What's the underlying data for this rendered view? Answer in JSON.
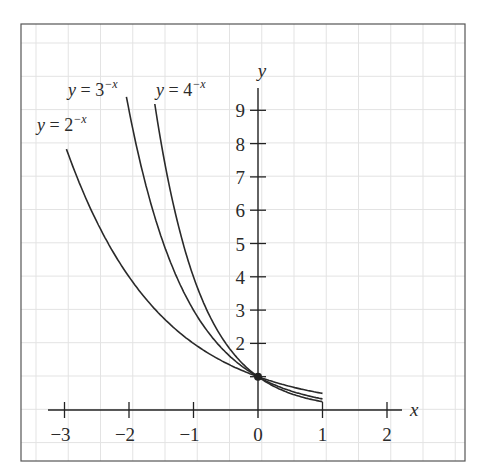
{
  "chart_data": {
    "type": "line",
    "title": "",
    "xlabel": "x",
    "ylabel": "y",
    "xlim": [
      -3.3,
      2.3
    ],
    "ylim": [
      0,
      9.5
    ],
    "x_ticks": [
      -3,
      -2,
      -1,
      0,
      1,
      2
    ],
    "x_tick_labels": [
      "−3",
      "−2",
      "−1",
      "0",
      "1",
      "2"
    ],
    "y_ticks": [
      1,
      2,
      3,
      4,
      5,
      6,
      7,
      8,
      9
    ],
    "y_tick_labels": [
      "",
      "2",
      "3",
      "4",
      "5",
      "6",
      "7",
      "8",
      "9"
    ],
    "grid": true,
    "series": [
      {
        "name": "y = 2^-x",
        "label_base": "y = 2",
        "label_exp": "−x",
        "base": 2,
        "x_range": [
          -2.97,
          1
        ],
        "points": [
          [
            -3,
            8
          ],
          [
            -2,
            4
          ],
          [
            -1,
            2
          ],
          [
            0,
            1
          ],
          [
            1,
            0.5
          ]
        ]
      },
      {
        "name": "y = 3^-x",
        "label_base": "y = 3",
        "label_exp": "−x",
        "base": 3,
        "x_range": [
          -2.04,
          1
        ],
        "points": [
          [
            -2,
            9
          ],
          [
            -1,
            3
          ],
          [
            0,
            1
          ],
          [
            1,
            0.333
          ]
        ]
      },
      {
        "name": "y = 4^-x",
        "label_base": "y = 4",
        "label_exp": "−x",
        "base": 4,
        "x_range": [
          -1.6,
          1
        ],
        "points": [
          [
            -1.5,
            8
          ],
          [
            -1,
            4
          ],
          [
            0,
            1
          ],
          [
            1,
            0.25
          ]
        ]
      }
    ],
    "annotations": [
      {
        "type": "point",
        "x": 0,
        "y": 1,
        "label": "common point (0, 1)"
      }
    ]
  }
}
